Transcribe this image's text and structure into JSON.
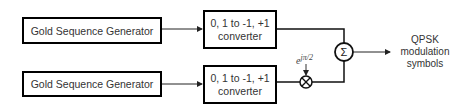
{
  "diagram": {
    "generators": [
      {
        "label": "Gold Sequence Generator"
      },
      {
        "label": "Gold Sequence Generator"
      }
    ],
    "converters": [
      {
        "line1": "0, 1 to -1, +1",
        "line2": "converter"
      },
      {
        "line1": "0, 1 to -1, +1",
        "line2": "converter"
      }
    ],
    "phase_factor": {
      "base": "e",
      "exponent": "jπ/2"
    },
    "summer": {
      "symbol": "Σ"
    },
    "multiplier": {
      "symbol": "⊗"
    },
    "output": {
      "line1": "QPSK",
      "line2": "modulation",
      "line3": "symbols"
    }
  }
}
